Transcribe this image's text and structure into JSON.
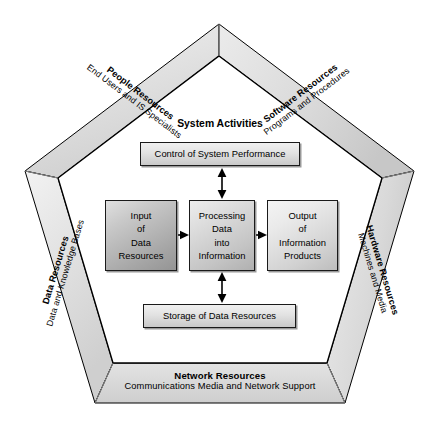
{
  "diagram": {
    "center_heading": "System Activities",
    "bands": [
      {
        "id": "people",
        "title": "People Resources",
        "subtitle": "End Users and IS Specialists"
      },
      {
        "id": "software",
        "title": "Software Resources",
        "subtitle": "Programs and Procedures"
      },
      {
        "id": "hardware",
        "title": "Hardware Resources",
        "subtitle": "Machines and Media"
      },
      {
        "id": "network",
        "title": "Network Resources",
        "subtitle": "Communications Media and Network Support"
      },
      {
        "id": "data",
        "title": "Data Resources",
        "subtitle": "Data and Knowledge Bases"
      }
    ],
    "boxes": [
      {
        "id": "control",
        "lines": [
          "Control of System Performance"
        ]
      },
      {
        "id": "input",
        "lines": [
          "Input",
          "of",
          "Data",
          "Resources"
        ]
      },
      {
        "id": "processing",
        "lines": [
          "Processing",
          "Data",
          "into",
          "Information"
        ]
      },
      {
        "id": "output",
        "lines": [
          "Output",
          "of",
          "Information",
          "Products"
        ]
      },
      {
        "id": "storage",
        "lines": [
          "Storage of Data Resources"
        ]
      }
    ],
    "colors": {
      "band_face": "#d9d9d9",
      "band_face_light": "#e6e6e6",
      "band_outline": "#000000",
      "box_outline": "#1a1a1a",
      "text": "#000000",
      "background": "#ffffff"
    }
  }
}
